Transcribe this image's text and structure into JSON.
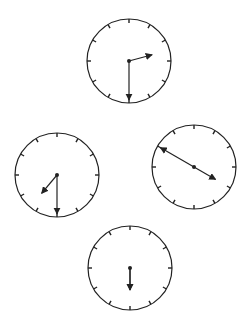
{
  "figure": {
    "colors": {
      "stroke": "#222222",
      "background": "#ffffff"
    },
    "clocks": [
      {
        "id": "top",
        "cx": 129,
        "cy": 61,
        "r": 42,
        "hour_angle": 75,
        "hour_len": 24,
        "minute_angle": 180,
        "minute_len": 39,
        "time": "2:30"
      },
      {
        "id": "left",
        "cx": 57,
        "cy": 175,
        "r": 42,
        "hour_angle": 220,
        "hour_len": 24,
        "minute_angle": 180,
        "minute_len": 39,
        "time": "7:30"
      },
      {
        "id": "right",
        "cx": 194,
        "cy": 167,
        "r": 42,
        "hour_angle": 120,
        "hour_len": 25,
        "minute_angle": 300,
        "minute_len": 39,
        "time": "3:50"
      },
      {
        "id": "bottom",
        "cx": 130,
        "cy": 268,
        "r": 42,
        "hour_angle": 180,
        "hour_len": 22,
        "minute_angle": 180,
        "minute_len": 22,
        "time": "6:00"
      }
    ]
  }
}
